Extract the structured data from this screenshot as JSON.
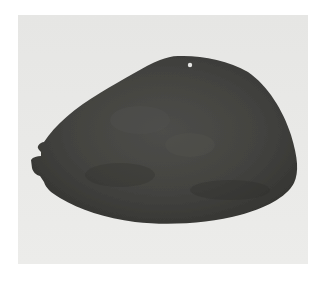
{
  "image": {
    "subject": "dark stone plaque pendant with suspension hole and notched edge",
    "description": "Photograph of a dark gray, teardrop/oval-shaped flat stone ornament on a light gray background. A small drilled hole near the top edge; a notched protrusion on the left edge.",
    "colors": {
      "page_background": "#ffffff",
      "panel_background": "#e8e8e6",
      "stone_dark": "#3b3b38",
      "stone_mid": "#4a4a46",
      "stone_highlight": "#5a5a55",
      "hole": "#e6e6e4"
    }
  }
}
